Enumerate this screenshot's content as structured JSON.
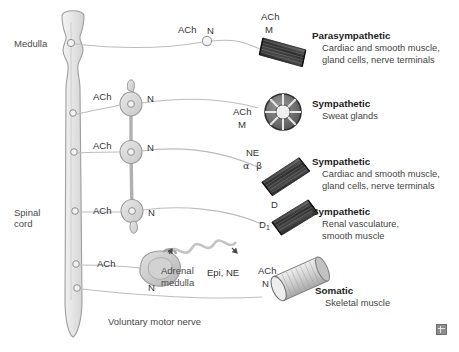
{
  "figure": {
    "anatomy": {
      "medulla_label": "Medulla",
      "spinal_cord_label_line1": "Spinal",
      "spinal_cord_label_line2": "cord",
      "adrenal_label_line1": "Adrenal",
      "adrenal_label_line2": "medulla",
      "voluntary_nerve_label": "Voluntary motor nerve"
    },
    "pathways": [
      {
        "id": "parasympathetic",
        "title": "Parasympathetic",
        "target_line1": "Cardiac and smooth muscle,",
        "target_line2": "gland cells, nerve terminals",
        "preganglionic_transmitter": "ACh",
        "preganglionic_receptor": "N",
        "postganglionic_transmitter": "ACh",
        "postganglionic_receptor": "M",
        "effector_icon": "dark-striated-muscle-bundle-icon"
      },
      {
        "id": "sympathetic-sweat",
        "title": "Sympathetic",
        "target_line1": "Sweat glands",
        "target_line2": "",
        "preganglionic_transmitter": "ACh",
        "preganglionic_receptor": "N",
        "postganglionic_transmitter": "ACh",
        "postganglionic_receptor": "M",
        "effector_icon": "sweat-gland-icon"
      },
      {
        "id": "sympathetic-adrenergic",
        "title": "Sympathetic",
        "target_line1": "Cardiac and smooth muscle,",
        "target_line2": "gland cells, nerve terminals",
        "preganglionic_transmitter": "ACh",
        "preganglionic_receptor": "N",
        "postganglionic_transmitter": "NE",
        "postganglionic_receptor_alpha": "α",
        "postganglionic_receptor_beta": "β",
        "effector_icon": "dark-striated-muscle-bundle-icon"
      },
      {
        "id": "sympathetic-dopaminergic",
        "title": "Sympathetic",
        "target_line1": "Renal vasculature,",
        "target_line2": "smooth muscle",
        "preganglionic_transmitter": "ACh",
        "preganglionic_receptor": "N",
        "postganglionic_transmitter": "D",
        "postganglionic_receptor_base": "D",
        "postganglionic_receptor_sub": "1",
        "effector_icon": "dark-striated-muscle-bundle-icon"
      },
      {
        "id": "adrenal-medulla",
        "preganglionic_transmitter": "ACh",
        "preganglionic_receptor": "N",
        "hormones": "Epi, NE",
        "effector_icon": "adrenal-gland-icon"
      },
      {
        "id": "somatic",
        "title": "Somatic",
        "target_line1": "Skeletal muscle",
        "target_line2": "",
        "preganglionic_transmitter": "ACh",
        "preganglionic_receptor": "N",
        "effector_icon": "skeletal-muscle-cylinder-icon"
      }
    ],
    "colors": {
      "background": "#ffffff",
      "nerve_line": "#b9b9b9",
      "cns_fill": "#e9e9e9",
      "cns_stroke": "#9a9a9a",
      "ganglion_fill": "#d8d8d8",
      "dark_muscle": "#3c3c3c",
      "light_muscle": "#d9d9d9",
      "text": "#333333"
    }
  }
}
